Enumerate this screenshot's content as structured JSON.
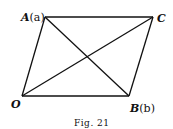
{
  "figure": {
    "caption": "Fig. 21",
    "vertices": {
      "O": {
        "label": "O",
        "x": 22,
        "y": 96
      },
      "A": {
        "label": "A",
        "sub": "(a)",
        "x": 45,
        "y": 17
      },
      "C": {
        "label": "C",
        "x": 153,
        "y": 17
      },
      "B": {
        "label": "B",
        "sub": "(b)",
        "x": 129,
        "y": 96
      }
    },
    "edges": [
      [
        "O",
        "A"
      ],
      [
        "A",
        "C"
      ],
      [
        "C",
        "B"
      ],
      [
        "B",
        "O"
      ]
    ],
    "diagonals": [
      [
        "O",
        "C"
      ],
      [
        "A",
        "B"
      ]
    ]
  }
}
